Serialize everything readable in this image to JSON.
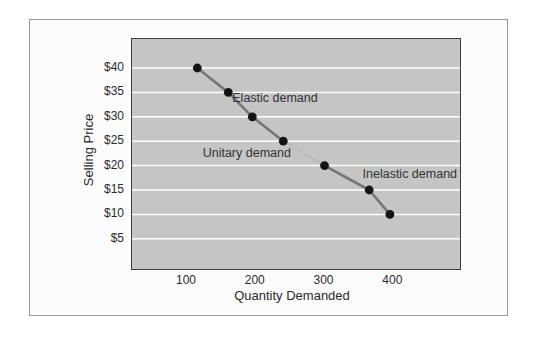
{
  "colors": {
    "page_bg": "#ffffff",
    "frame_bg": "#fcfcfc",
    "frame_border": "#9a9a9a",
    "plot_bg": "#c5c5c5",
    "plot_border": "#3f3f3f",
    "gridline": "#ffffff",
    "curve": "#757575",
    "curve_faint": "#bdbdbd",
    "marker": "#141414",
    "text": "#333333"
  },
  "chart_data": {
    "type": "line",
    "title": "",
    "xlabel": "Quantity Demanded",
    "ylabel": "Selling Price",
    "xlim": [
      20,
      497
    ],
    "ylim": [
      -1.2,
      45.95
    ],
    "grid": "horizontal-only",
    "legend": "none",
    "x_ticks": [
      {
        "label": "100",
        "value": 100
      },
      {
        "label": "200",
        "value": 200
      },
      {
        "label": "300",
        "value": 300
      },
      {
        "label": "400",
        "value": 400
      }
    ],
    "y_ticks": [
      {
        "label": "$40",
        "value": 40
      },
      {
        "label": "$35",
        "value": 35
      },
      {
        "label": "$30",
        "value": 30
      },
      {
        "label": "$25",
        "value": 25
      },
      {
        "label": "$20",
        "value": 20
      },
      {
        "label": "$15",
        "value": 15
      },
      {
        "label": "$10",
        "value": 10
      },
      {
        "label": "$5",
        "value": 5
      }
    ],
    "points": [
      {
        "quantity": 115,
        "price": 40
      },
      {
        "quantity": 160,
        "price": 35
      },
      {
        "quantity": 195,
        "price": 30
      },
      {
        "quantity": 240,
        "price": 25
      },
      {
        "quantity": 300,
        "price": 20
      },
      {
        "quantity": 365,
        "price": 15
      },
      {
        "quantity": 395,
        "price": 10
      }
    ],
    "faint_segment_between_points": [
      3,
      4
    ],
    "annotations": [
      {
        "label": "Elastic demand",
        "q": 228,
        "p": 34.0
      },
      {
        "label": "Unitary demand",
        "q": 187,
        "p": 22.7
      },
      {
        "label": "Inelastic demand",
        "q": 424,
        "p": 18.4
      }
    ]
  }
}
